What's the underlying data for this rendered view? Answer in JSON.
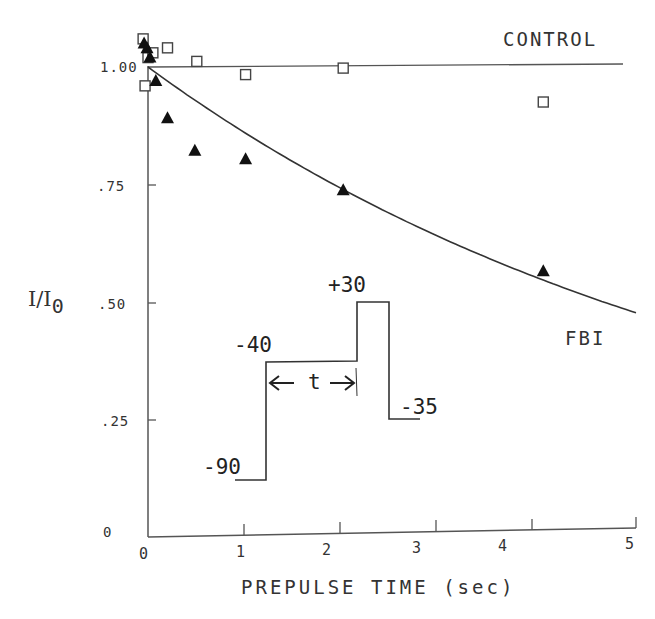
{
  "chart_data": {
    "type": "scatter",
    "title": "",
    "xlabel": "PREPULSE TIME (sec)",
    "ylabel": "I/I0",
    "ylabel_main": "I/I",
    "ylabel_sub": "0",
    "xlim": [
      0,
      5
    ],
    "ylim": [
      0,
      1.07
    ],
    "grid": false,
    "legend": "inline labels",
    "x_ticks": [
      "0",
      "1",
      "2",
      "3",
      "4",
      "5"
    ],
    "y_ticks": [
      "0",
      ".25",
      ".50",
      ".75",
      "1.00"
    ],
    "series": [
      {
        "name": "CONTROL",
        "marker": "open-square",
        "points": [
          {
            "x": -0.05,
            "y": 1.06
          },
          {
            "x": -0.03,
            "y": 0.96
          },
          {
            "x": 0.0,
            "y": 1.02
          },
          {
            "x": 0.05,
            "y": 1.03
          },
          {
            "x": 0.2,
            "y": 1.04
          },
          {
            "x": 0.5,
            "y": 1.01
          },
          {
            "x": 1.0,
            "y": 0.98
          },
          {
            "x": 2.0,
            "y": 0.99
          },
          {
            "x": 4.05,
            "y": 0.91
          }
        ],
        "fit": {
          "type": "constant",
          "value": 1.0
        }
      },
      {
        "name": "FBI",
        "marker": "filled-triangle",
        "points": [
          {
            "x": -0.04,
            "y": 1.05
          },
          {
            "x": -0.01,
            "y": 1.04
          },
          {
            "x": 0.02,
            "y": 1.02
          },
          {
            "x": 0.08,
            "y": 0.97
          },
          {
            "x": 0.2,
            "y": 0.89
          },
          {
            "x": 0.48,
            "y": 0.82
          },
          {
            "x": 1.0,
            "y": 0.8
          },
          {
            "x": 2.0,
            "y": 0.73
          },
          {
            "x": 4.05,
            "y": 0.55
          }
        ],
        "fit": {
          "type": "exponential",
          "tau_sec": 6.4,
          "end_value_at_5s": 0.46
        }
      }
    ],
    "annotations": [
      {
        "text": "CONTROL",
        "near": "control line, upper right"
      },
      {
        "text": "FBI",
        "near": "exponential curve, right"
      }
    ],
    "inset": {
      "description": "voltage protocol",
      "levels_mV": [
        "-90",
        "-40",
        "+30",
        "-35"
      ],
      "interval_label": "t",
      "left_arrow": "←",
      "right_arrow": "→"
    }
  }
}
